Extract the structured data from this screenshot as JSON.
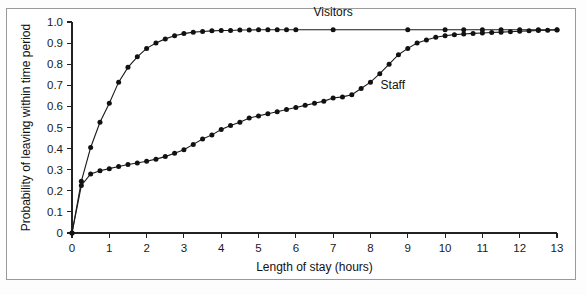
{
  "chart_data": {
    "type": "line",
    "title": "",
    "xlabel": "Length of stay (hours)",
    "ylabel": "Probability of leaving within time period",
    "xlim": [
      0,
      13
    ],
    "ylim": [
      0,
      1.0
    ],
    "grid": false,
    "legend_position": "inline-annotation",
    "xticks": [
      "0",
      "1",
      "2",
      "3",
      "4",
      "5",
      "6",
      "7",
      "8",
      "9",
      "10",
      "11",
      "12",
      "13"
    ],
    "xtick_values": [
      0,
      1,
      2,
      3,
      4,
      5,
      6,
      7,
      8,
      9,
      10,
      11,
      12,
      13
    ],
    "yticks": [
      "0",
      "0.1",
      "0.2",
      "0.3",
      "0.4",
      "0.5",
      "0.6",
      "0.7",
      "0.8",
      "0.9",
      "1.0"
    ],
    "ytick_values": [
      0,
      0.1,
      0.2,
      0.3,
      0.4,
      0.5,
      0.6,
      0.7,
      0.8,
      0.9,
      1.0
    ],
    "marker": "filled-circle",
    "series": [
      {
        "name": "Visitors",
        "label": "Visitors",
        "color": "#111111",
        "x": [
          0,
          0.25,
          0.5,
          0.75,
          1.0,
          1.25,
          1.5,
          1.75,
          2.0,
          2.25,
          2.5,
          2.75,
          3.0,
          3.25,
          3.5,
          3.75,
          4.0,
          4.25,
          4.5,
          4.75,
          5.0,
          5.25,
          5.5,
          5.75,
          6.0,
          7.0,
          9.0,
          10.0,
          10.5,
          11.0,
          11.5,
          12.0,
          12.5,
          13.0
        ],
        "values": [
          0.0,
          0.245,
          0.405,
          0.525,
          0.615,
          0.715,
          0.785,
          0.835,
          0.875,
          0.9,
          0.92,
          0.935,
          0.945,
          0.952,
          0.955,
          0.958,
          0.96,
          0.96,
          0.962,
          0.962,
          0.963,
          0.963,
          0.963,
          0.963,
          0.963,
          0.963,
          0.963,
          0.963,
          0.963,
          0.963,
          0.963,
          0.963,
          0.963,
          0.963
        ]
      },
      {
        "name": "Staff",
        "label": "Staff",
        "color": "#111111",
        "x": [
          0,
          0.25,
          0.5,
          0.75,
          1.0,
          1.25,
          1.5,
          1.75,
          2.0,
          2.25,
          2.5,
          2.75,
          3.0,
          3.25,
          3.5,
          3.75,
          4.0,
          4.25,
          4.5,
          4.75,
          5.0,
          5.25,
          5.5,
          5.75,
          6.0,
          6.25,
          6.5,
          6.75,
          7.0,
          7.25,
          7.5,
          7.75,
          8.0,
          8.25,
          8.5,
          8.75,
          9.0,
          9.25,
          9.5,
          9.75,
          10.0,
          10.25,
          10.5,
          10.75,
          11.0,
          11.25,
          11.5,
          11.75,
          12.0,
          12.25,
          12.5,
          12.75,
          13.0
        ],
        "values": [
          0.0,
          0.225,
          0.28,
          0.295,
          0.305,
          0.315,
          0.325,
          0.332,
          0.34,
          0.35,
          0.362,
          0.378,
          0.395,
          0.42,
          0.445,
          0.465,
          0.49,
          0.51,
          0.525,
          0.545,
          0.555,
          0.565,
          0.575,
          0.585,
          0.595,
          0.605,
          0.615,
          0.625,
          0.64,
          0.645,
          0.655,
          0.685,
          0.715,
          0.755,
          0.8,
          0.845,
          0.875,
          0.9,
          0.915,
          0.928,
          0.935,
          0.94,
          0.943,
          0.946,
          0.948,
          0.95,
          0.952,
          0.954,
          0.956,
          0.958,
          0.96,
          0.961,
          0.962
        ]
      }
    ],
    "annotations": [
      {
        "text": "Visitors",
        "x": 7.0,
        "y": 1.0,
        "series": "Visitors"
      },
      {
        "text": "Staff",
        "x": 8.6,
        "y": 0.655,
        "series": "Staff"
      }
    ]
  }
}
